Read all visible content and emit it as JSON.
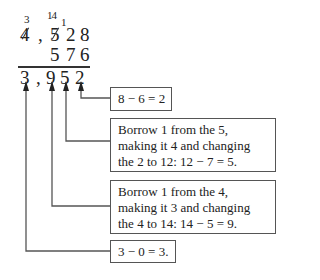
{
  "problem": {
    "top_row": [
      "4",
      ",",
      "5",
      "2",
      "8"
    ],
    "second_row": [
      "5",
      "7",
      "6"
    ],
    "result_row": [
      "3",
      ",",
      "9",
      "5",
      "2"
    ],
    "borrow_marks": {
      "over_thousands": "3",
      "over_hundreds": "14",
      "over_tens": "1"
    }
  },
  "annotations": [
    {
      "target_digit": "2",
      "text": "8 − 6 = 2"
    },
    {
      "target_digit": "5",
      "text": "Borrow 1 from the 5, making it 4 and changing the 2 to 12: 12 − 7 = 5."
    },
    {
      "target_digit": "9",
      "text": "Borrow 1 from the 4, making it 3 and changing the 4 to 14: 14 − 5 = 9."
    },
    {
      "target_digit": "3",
      "text": "3 − 0 = 3."
    }
  ]
}
